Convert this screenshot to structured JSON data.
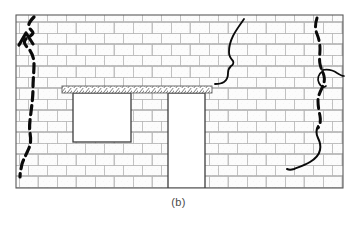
{
  "figure": {
    "caption": "(b)",
    "type": "engineering-diagram",
    "colors": {
      "background": "#ffffff",
      "brick_face": "#fbfbfb",
      "mortar_joint": "#9b9b9b",
      "wall_outline": "#5a5a5a",
      "opening_fill": "#ffffff",
      "opening_outline": "#3c3c3c",
      "lintel_hatch": "#6e6e6e",
      "crack_heavy": "#0a0a0a",
      "crack_fine": "#0a0a0a",
      "caption_text": "#4a4a4a"
    },
    "wall": {
      "label": "masonry-wall-panel",
      "x": 16,
      "y": 15,
      "width": 327,
      "height": 173,
      "course_height": 11,
      "brick_length": 38,
      "bond": "running bond"
    },
    "openings": [
      {
        "name": "window-opening",
        "label": "Window",
        "x": 73,
        "y": 93,
        "width": 58,
        "height": 49
      },
      {
        "name": "door-opening",
        "label": "Door",
        "x": 168,
        "y": 93,
        "width": 37,
        "height": 95
      }
    ],
    "lintel": {
      "name": "lintel-beam",
      "label": "Lintel",
      "x": 62,
      "y": 86,
      "width": 150,
      "height": 7,
      "hatch": "diagonal"
    },
    "cracks": [
      {
        "name": "crack-left-heavy",
        "label": "Left vertical crack",
        "style": "heavy-dashed",
        "width": 3.2,
        "dash": "9 5",
        "path": "M 34 17 C 30 21, 28 24, 29 27 C 30 30, 33 31, 33 33 C 32 36, 27 37, 25 40 C 23 43, 26 46, 29 49 C 32 53, 34 58, 34 64 C 34 72, 33 80, 33 88 C 33 96, 32 104, 31 112 C 30 120, 29 127, 30 133 C 31 139, 31 143, 29 148 C 27 153, 24 158, 22 164 C 21 169, 20 173, 20 177"
      },
      {
        "name": "crack-left-chevron",
        "label": "Left crack branch",
        "style": "heavy-solid",
        "width": 3.2,
        "dash": "none",
        "path": "M 19 45 L 26 33 L 33 44"
      },
      {
        "name": "crack-upper-middle-fine",
        "label": "Upper middle fine crack",
        "style": "fine-solid",
        "width": 1.8,
        "dash": "none",
        "path": "M 244 19 C 240 25, 236 30, 233 36 C 230 42, 229 47, 229 52 C 229 56, 231 59, 233 61 C 234 63, 233 65, 231 66 C 229 68, 228 70, 228 73 C 228 77, 227 80, 224 82 C 221 84, 218 84, 215 84"
      },
      {
        "name": "crack-right-heavy",
        "label": "Right vertical crack",
        "style": "heavy-dashed",
        "width": 3.0,
        "dash": "9 5",
        "path": "M 317 18 C 315 24, 315 29, 317 34 C 319 39, 320 44, 320 49 C 320 54, 319 59, 320 64 C 321 69, 323 72, 324 76 C 325 80, 324 84, 322 88 C 320 92, 318 96, 318 101 C 318 106, 319 111, 320 116 C 321 121, 320 125, 318 128"
      },
      {
        "name": "crack-right-loop",
        "label": "Right crack loop branch",
        "style": "fine-solid",
        "width": 1.7,
        "dash": "none",
        "path": "M 322 70 C 327 69, 333 70, 337 73 C 340 75, 342 76, 344 76 M 322 71 C 318 74, 317 79, 319 83 C 321 87, 324 88, 326 86"
      },
      {
        "name": "crack-right-lower-fine",
        "label": "Right lower fine crack",
        "style": "fine-solid",
        "width": 2.0,
        "dash": "none",
        "path": "M 318 126 C 316 130, 316 134, 318 138 C 320 142, 321 146, 320 150 C 319 155, 315 159, 310 162 C 305 165, 299 167, 294 169 C 291 170, 289 170, 287 169"
      }
    ]
  }
}
